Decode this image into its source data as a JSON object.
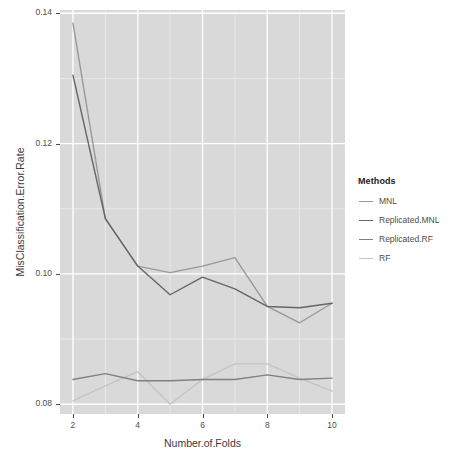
{
  "chart_data": {
    "type": "line",
    "title": "",
    "xlabel": "Number.of.Folds",
    "ylabel": "MisClassification.Error.Rate",
    "x": [
      2,
      3,
      4,
      5,
      6,
      7,
      8,
      9,
      10
    ],
    "xlim": [
      1.6,
      10.4
    ],
    "ylim": [
      0.0785,
      0.1405
    ],
    "xticks": [
      2,
      4,
      6,
      8,
      10
    ],
    "xtick_labels": [
      "2",
      "4",
      "6",
      "8",
      "10"
    ],
    "yticks": [
      0.08,
      0.1,
      0.12,
      0.14
    ],
    "ytick_labels": [
      "0.08",
      "0.10",
      "0.12",
      "0.14"
    ],
    "grid": true,
    "grid_major_color": "#ffffff",
    "grid_minor_color": "#ececec",
    "panel_background": "#d9d9d9",
    "legend_position": "right",
    "legend_title": "Methods",
    "series": [
      {
        "name": "MNL",
        "color": "#999999",
        "values": [
          0.1385,
          0.1085,
          0.1012,
          0.1002,
          0.1012,
          0.1025,
          0.095,
          0.0925,
          0.0955
        ]
      },
      {
        "name": "Replicated.MNL",
        "color": "#666666",
        "values": [
          0.1305,
          0.1085,
          0.1012,
          0.0968,
          0.0995,
          0.0977,
          0.095,
          0.0948,
          0.0955
        ]
      },
      {
        "name": "Replicated.RF",
        "color": "#808080",
        "values": [
          0.0838,
          0.0847,
          0.0836,
          0.0836,
          0.0838,
          0.0838,
          0.0845,
          0.0838,
          0.084
        ]
      },
      {
        "name": "RF",
        "color": "#c4c4c4",
        "values": [
          0.0805,
          0.0828,
          0.085,
          0.08,
          0.0838,
          0.0862,
          0.0862,
          0.084,
          0.082
        ]
      }
    ]
  },
  "legend": {
    "title": "Methods",
    "items": [
      {
        "label": "MNL",
        "color": "#999999"
      },
      {
        "label": "Replicated.MNL",
        "color": "#666666"
      },
      {
        "label": "Replicated.RF",
        "color": "#808080"
      },
      {
        "label": "RF",
        "color": "#c4c4c4"
      }
    ]
  },
  "axes": {
    "x_title": "Number.of.Folds",
    "y_title": "MisClassification.Error.Rate",
    "x_tick_labels": [
      "2",
      "4",
      "6",
      "8",
      "10"
    ],
    "y_tick_labels": [
      "0.08",
      "0.10",
      "0.12",
      "0.14"
    ]
  }
}
